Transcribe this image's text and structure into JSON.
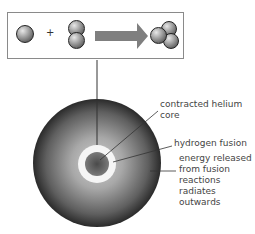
{
  "reaction": {
    "plus": "+",
    "reactant_1": "hydrogen-nucleus",
    "reactant_2": "deuterium-pair",
    "product": "helium-nucleus",
    "arrow": "right-arrow"
  },
  "labels": {
    "core": "contracted helium\ncore",
    "fusion": "hydrogen fusion",
    "energy": "energy released\nfrom fusion\nreactions\nradiates\noutwards"
  },
  "colors": {
    "arrow": "#7f7f7f",
    "ring": "#f5f5f5",
    "star_outer": "#2b2b2b",
    "star_inner": "#bdbdbd"
  }
}
